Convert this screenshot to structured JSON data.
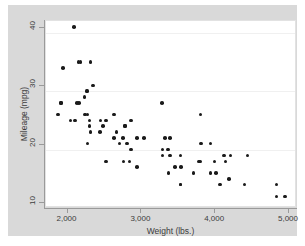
{
  "figure": {
    "name": "mpg-vs-weight-scatter",
    "background_color": "#d9d9d9",
    "plot_background_color": "#ffffff",
    "marker_color": "#1a1a1a",
    "gridline_color": "#f0f0f0",
    "axis_color": "#9a9a9a"
  },
  "chart_data": {
    "type": "scatter",
    "title": "",
    "xlabel": "Weight (lbs.)",
    "ylabel": "Mileage (mpg)",
    "xlim": [
      1600,
      5000
    ],
    "ylim": [
      10,
      42
    ],
    "xticks": [
      2000,
      3000,
      4000,
      5000
    ],
    "xtick_labels": [
      "2,000",
      "3,000",
      "4,000",
      "5,000"
    ],
    "yticks": [
      10,
      20,
      30,
      40
    ],
    "ytick_labels": [
      "10",
      "20",
      "30",
      "40"
    ],
    "grid": true,
    "grid_axis": "y",
    "legend": false,
    "marker": "circle",
    "n_points": 74,
    "points": [
      {
        "x": 2930,
        "y": 22
      },
      {
        "x": 3350,
        "y": 17
      },
      {
        "x": 2640,
        "y": 22
      },
      {
        "x": 3250,
        "y": 20
      },
      {
        "x": 4080,
        "y": 15
      },
      {
        "x": 3670,
        "y": 18
      },
      {
        "x": 3690,
        "y": 26
      },
      {
        "x": 3180,
        "y": 20
      },
      {
        "x": 3830,
        "y": 16
      },
      {
        "x": 4330,
        "y": 19
      },
      {
        "x": 4290,
        "y": 14
      },
      {
        "x": 4720,
        "y": 14
      },
      {
        "x": 3700,
        "y": 21
      },
      {
        "x": 3955,
        "y": 14
      },
      {
        "x": 3830,
        "y": 21
      },
      {
        "x": 4010,
        "y": 19
      },
      {
        "x": 4100,
        "y": 19
      },
      {
        "x": 3690,
        "y": 18
      },
      {
        "x": 3180,
        "y": 19
      },
      {
        "x": 3280,
        "y": 19
      },
      {
        "x": 3880,
        "y": 18
      },
      {
        "x": 4030,
        "y": 18
      },
      {
        "x": 3900,
        "y": 16
      },
      {
        "x": 4840,
        "y": 12
      },
      {
        "x": 4720,
        "y": 12
      },
      {
        "x": 3430,
        "y": 17
      },
      {
        "x": 3260,
        "y": 16
      },
      {
        "x": 3600,
        "y": 16
      },
      {
        "x": 2830,
        "y": 22
      },
      {
        "x": 2050,
        "y": 28
      },
      {
        "x": 2410,
        "y": 25
      },
      {
        "x": 2200,
        "y": 23
      },
      {
        "x": 2520,
        "y": 22
      },
      {
        "x": 2330,
        "y": 23
      },
      {
        "x": 2370,
        "y": 24
      },
      {
        "x": 2020,
        "y": 28
      },
      {
        "x": 2130,
        "y": 26
      },
      {
        "x": 2190,
        "y": 24
      },
      {
        "x": 2670,
        "y": 24
      },
      {
        "x": 2595,
        "y": 21
      },
      {
        "x": 2700,
        "y": 21
      },
      {
        "x": 2556,
        "y": 23
      },
      {
        "x": 2340,
        "y": 25
      },
      {
        "x": 2200,
        "y": 35
      },
      {
        "x": 2150,
        "y": 30
      },
      {
        "x": 1800,
        "y": 28
      },
      {
        "x": 1800,
        "y": 28
      },
      {
        "x": 2040,
        "y": 35
      },
      {
        "x": 1930,
        "y": 25
      },
      {
        "x": 1990,
        "y": 25
      },
      {
        "x": 2160,
        "y": 21
      },
      {
        "x": 2670,
        "y": 24
      },
      {
        "x": 2750,
        "y": 25
      },
      {
        "x": 3170,
        "y": 28
      },
      {
        "x": 2650,
        "y": 18
      },
      {
        "x": 2750,
        "y": 20
      },
      {
        "x": 2120,
        "y": 29
      },
      {
        "x": 2240,
        "y": 31
      },
      {
        "x": 2160,
        "y": 30
      },
      {
        "x": 1980,
        "y": 41
      },
      {
        "x": 2070,
        "y": 35
      },
      {
        "x": 2190,
        "y": 25
      },
      {
        "x": 2160,
        "y": 26
      },
      {
        "x": 1830,
        "y": 34
      },
      {
        "x": 1760,
        "y": 26
      },
      {
        "x": 2410,
        "y": 18
      },
      {
        "x": 2730,
        "y": 18
      },
      {
        "x": 2830,
        "y": 17
      },
      {
        "x": 3210,
        "y": 22
      },
      {
        "x": 3280,
        "y": 22
      },
      {
        "x": 3420,
        "y": 19
      },
      {
        "x": 3420,
        "y": 14
      },
      {
        "x": 3420,
        "y": 14
      },
      {
        "x": 2520,
        "y": 26
      }
    ]
  }
}
